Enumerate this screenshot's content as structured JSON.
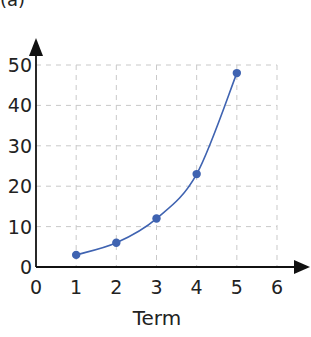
{
  "corner_label": "(a)",
  "chart_data": {
    "type": "line",
    "title": "",
    "xlabel": "Term",
    "ylabel": "",
    "x": [
      1,
      2,
      3,
      4,
      5
    ],
    "values": [
      3,
      6,
      12,
      23,
      48
    ],
    "xlim": [
      0,
      6
    ],
    "ylim": [
      0,
      50
    ],
    "x_ticks": [
      0,
      1,
      2,
      3,
      4,
      5,
      6
    ],
    "y_ticks": [
      0,
      10,
      20,
      30,
      40,
      50
    ],
    "grid": true,
    "grid_style": "dashed",
    "smooth_curve": true,
    "marker": "circle",
    "series_color": "#3f63b1",
    "axis_color": "#111111",
    "grid_color": "#c9c9c9"
  }
}
